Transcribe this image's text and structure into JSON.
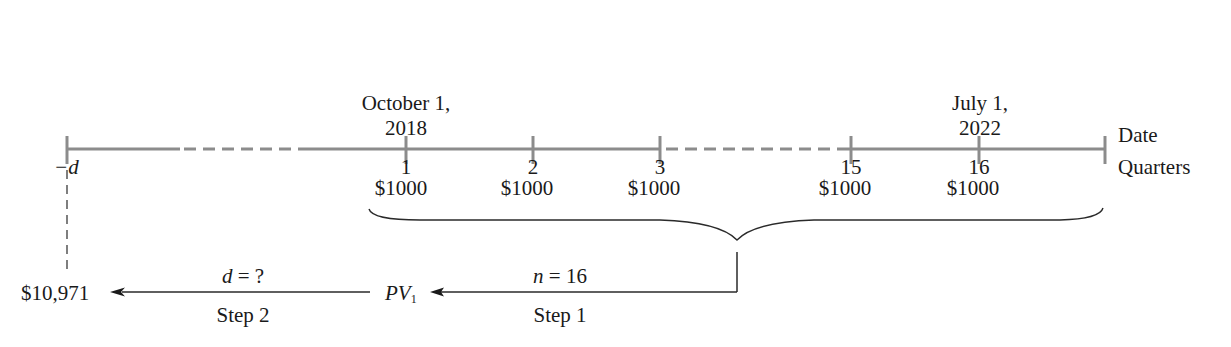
{
  "diagram": {
    "type": "cash-flow-timeline",
    "row_labels": {
      "date": "Date",
      "quarters": "Quarters"
    },
    "start_label": "−d",
    "dates": [
      {
        "line1": "October 1,",
        "line2": "2018",
        "at_quarter": "1"
      },
      {
        "line1": "July 1,",
        "line2": "2022",
        "at_quarter": "16"
      }
    ],
    "quarters": [
      "1",
      "2",
      "3",
      "15",
      "16"
    ],
    "payments": [
      "$1000",
      "$1000",
      "$1000",
      "$1000",
      "$1000"
    ],
    "step1": {
      "top_label": "n = 16",
      "n_var": "n",
      "n_eq": " = 16",
      "result": "PV",
      "result_sub": "1",
      "bottom_label": "Step 1"
    },
    "step2": {
      "top_label": "d = ?",
      "d_var": "d",
      "d_eq": " = ?",
      "result": "$10,971",
      "bottom_label": "Step 2"
    },
    "colors": {
      "timeline": "#8c8c8c",
      "ink": "#1a1a1a"
    }
  }
}
